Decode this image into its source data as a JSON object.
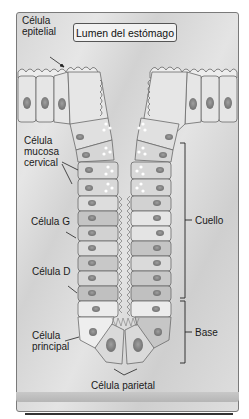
{
  "diagram": {
    "title_box": "Lumen del estómago",
    "labels": {
      "epithelial": [
        "Célula",
        "epitelial"
      ],
      "mucous_neck": [
        "Célula",
        "mucosa",
        "cervical"
      ],
      "g_cell": "Célula G",
      "d_cell": "Célula D",
      "chief": [
        "Célula",
        "principal"
      ],
      "parietal": "Célula parietal",
      "neck_region": "Cuello",
      "base_region": "Base"
    },
    "colors": {
      "background": "#dcdcdc",
      "cell_light": "#e8e8e8",
      "cell_mid": "#cfcfcf",
      "cell_dark": "#b8b8b8",
      "nucleus": "#8a8a8a",
      "outline": "#6a6a6a",
      "text": "#1a1a1a"
    }
  }
}
